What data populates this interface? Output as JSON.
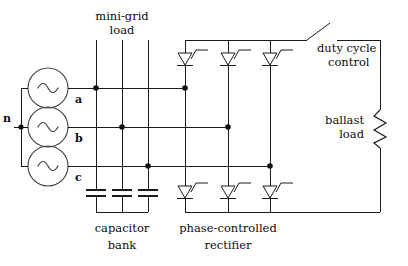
{
  "figure": {
    "background_color": "#ffffff",
    "line_color": "#1a1a1a"
  },
  "labels": {
    "minigrid_load_line1": "mini-grid",
    "minigrid_load_line2": "load",
    "duty_cycle_line1": "duty cycle",
    "duty_cycle_line2": "control",
    "ballast_line1": "ballast",
    "ballast_line2": "load",
    "capacitor_bank_line1": "capacitor",
    "capacitor_bank_line2": "bank",
    "rectifier_line1": "phase-controlled",
    "rectifier_line2": "rectifier",
    "phase_a": "a",
    "phase_b": "b",
    "phase_c": "c",
    "neutral": "n"
  },
  "sources": [
    {
      "name": "source-phase-a",
      "symbol": "ac-sine",
      "terminal": "a"
    },
    {
      "name": "source-phase-b",
      "symbol": "ac-sine",
      "terminal": "b"
    },
    {
      "name": "source-phase-c",
      "symbol": "ac-sine",
      "terminal": "c"
    }
  ],
  "minigrid_load": {
    "branches": 3,
    "note": "three vertical feeder branches"
  },
  "capacitor_bank": {
    "count": 3,
    "symbol": "capacitor-plates",
    "connection": "wye"
  },
  "rectifier": {
    "type": "three-phase full-bridge thyristor",
    "legs": 3,
    "devices_per_leg": 2,
    "symbol": "thyristor",
    "upper_devices": [
      "thyristor-a-upper",
      "thyristor-b-upper",
      "thyristor-c-upper"
    ],
    "lower_devices": [
      "thyristor-a-lower",
      "thyristor-b-lower",
      "thyristor-c-lower"
    ]
  },
  "ballast": {
    "element": "resistor",
    "symbol": "zigzag-resistor"
  },
  "switch": {
    "name": "duty-cycle-switch",
    "state": "open",
    "symbol": "spst-open"
  }
}
